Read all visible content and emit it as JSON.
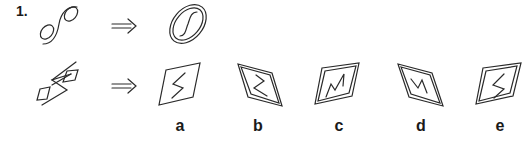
{
  "question": {
    "number": "1.",
    "example": {
      "source_figure": "two-small-ellipses-joined-by-s-curve",
      "arrow": "double-arrow-right",
      "result_figure": "double-ellipse-with-s-curve-inside"
    },
    "problem": {
      "source_figure": "two-small-parallelograms-joined-by-zigzag",
      "arrow": "double-arrow-right"
    },
    "options": [
      {
        "label": "a",
        "description": "single parallelogram with S-shaped zigzag"
      },
      {
        "label": "b",
        "description": "double parallelogram with Z-shaped zigzag"
      },
      {
        "label": "c",
        "description": "double parallelogram with N-shaped zigzag"
      },
      {
        "label": "d",
        "description": "double parallelogram with W-shaped zigzag"
      },
      {
        "label": "e",
        "description": "double parallelogram with S-shaped zigzag"
      }
    ]
  },
  "colors": {
    "ink": "#2a2a2a",
    "background": "#ffffff"
  }
}
